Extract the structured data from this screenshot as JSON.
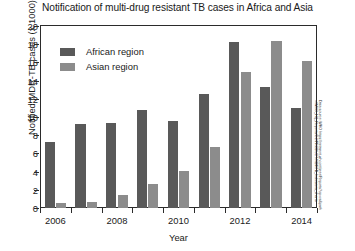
{
  "chart_data": {
    "type": "bar",
    "title": "Notification of multi-drug resistant TB cases in Africa and Asia",
    "xlabel": "Year",
    "ylabel": "Notified MDR-TB cases (x 1000)",
    "categories": [
      "2006",
      "2007",
      "2008",
      "2009",
      "2010",
      "2011",
      "2012",
      "2013",
      "2014"
    ],
    "x_tick_labels": [
      "2006",
      "",
      "2008",
      "",
      "2010",
      "",
      "2012",
      "",
      "2014"
    ],
    "series": [
      {
        "name": "African region",
        "color": "#595959",
        "values": [
          7.2,
          9.2,
          9.3,
          10.8,
          9.6,
          12.5,
          18.2,
          13.3,
          11.0
        ]
      },
      {
        "name": "Asian region",
        "color": "#8c8c8c",
        "values": [
          0.5,
          0.7,
          1.4,
          2.6,
          4.1,
          6.7,
          15.0,
          18.3,
          16.2
        ]
      }
    ],
    "ylim": [
      0,
      20
    ],
    "y_ticks": [
      0,
      2,
      4,
      6,
      8,
      10,
      12,
      14,
      16,
      18,
      20
    ],
    "grid": false,
    "legend_position": "top-left",
    "source_note": "Data source: WHO https://extranet.who.int/sree/Reports?op=vs&path=/WHO_HQ_Reports/G2/PRODUCT/MDRTB_Indicators_charts"
  }
}
